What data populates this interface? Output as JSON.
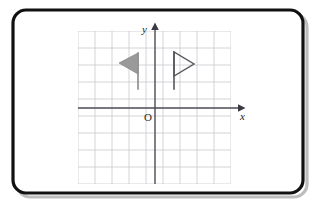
{
  "figure": {
    "background_color": "#ffffff"
  },
  "frame": {
    "name": "rounded-border-frame",
    "stroke_color": "#111111",
    "stroke_width": 3.2,
    "corner_radius": 13,
    "x": 13,
    "y": 10,
    "width": 290,
    "height": 183,
    "shadow_color": "#bdbdbd",
    "shadow_offset_x": 4,
    "shadow_offset_y": 4
  },
  "grid": {
    "name": "coordinate-grid",
    "line_color": "#c9c9cf",
    "line_width": 0.8,
    "spacing": 17,
    "x_start": 78,
    "x_end": 231,
    "y_start": 31,
    "y_end": 184,
    "vertical_lines": [
      78,
      95,
      112,
      129,
      146,
      163,
      180,
      197,
      214,
      231
    ],
    "horizontal_lines": [
      31,
      48,
      65,
      82,
      99,
      116,
      133,
      150,
      167,
      184
    ]
  },
  "axes": {
    "color": "#4a4a52",
    "line_width": 1.4,
    "x_axis": {
      "name": "x-axis",
      "label": "x",
      "y": 108,
      "x_start": 78,
      "x_end": 238,
      "label_x": 240,
      "label_y": 120,
      "arrow": "right"
    },
    "y_axis": {
      "name": "y-axis",
      "label": "y",
      "x": 155,
      "y_start": 184,
      "y_end": 30,
      "label_x": 147,
      "label_y": 33,
      "arrow": "up"
    },
    "origin": {
      "name": "origin-label",
      "label": "O",
      "x": 148,
      "y": 121
    }
  },
  "shapes": [
    {
      "name": "flag-left-filled",
      "type": "flag",
      "direction": "left",
      "fill": "#9a9a9a",
      "stroke": "#8a8a8a",
      "pole": {
        "x": 138,
        "y_top": 53,
        "y_bottom": 89,
        "width": 1.6,
        "color": "#8a8a8a"
      },
      "banner_points": "138,53 138,74 119,63"
    },
    {
      "name": "flag-right-outline",
      "type": "flag",
      "direction": "right",
      "fill": "none",
      "stroke": "#55555c",
      "pole": {
        "x": 174,
        "y_top": 52,
        "y_bottom": 89,
        "width": 1.6,
        "color": "#55555c"
      },
      "banner_points": "174,52 174,76 194,64"
    }
  ]
}
